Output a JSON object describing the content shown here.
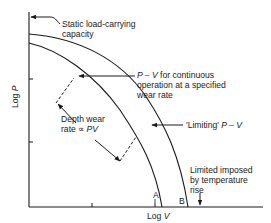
{
  "axes": {
    "y_label": "Log P",
    "x_label": "Log V"
  },
  "curves": [
    {
      "id": "A",
      "label": "A",
      "description": "P – V for continuous operation at a specified wear rate"
    },
    {
      "id": "B",
      "label": "B",
      "description": "'Limiting' P – V"
    }
  ],
  "annotations": {
    "static_load": [
      "Static load-carrying",
      "capacity"
    ],
    "continuous": {
      "prefix": "P – V",
      "line1_rest": " for continuous",
      "line2": "operation at a specified",
      "line3": "wear rate"
    },
    "depth_wear": {
      "line1": "Depth wear",
      "line2_prefix": "rate ∝ ",
      "line2_var": "PV"
    },
    "limiting": {
      "prefix": "'Limiting' ",
      "var": "P – V"
    },
    "temperature": [
      "Limited imposed",
      "by temperature",
      "rise"
    ]
  },
  "colors": {
    "ink": "#1a1a1a",
    "background": "#ffffff"
  }
}
